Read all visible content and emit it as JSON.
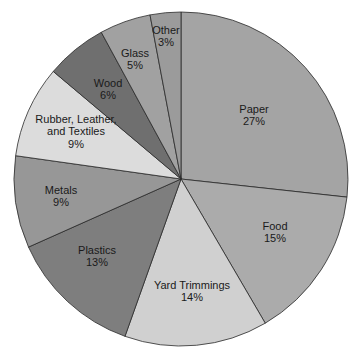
{
  "chart_data": {
    "type": "pie",
    "title": "",
    "start_angle_deg": 0,
    "direction": "clockwise",
    "legend": "none",
    "slices": [
      {
        "label": "Paper",
        "value": 27,
        "display": "27%",
        "color": "#a4a4a4",
        "label_lines": [
          "Paper"
        ],
        "lx": 254,
        "ly": 115
      },
      {
        "label": "Food",
        "value": 15,
        "display": "15%",
        "color": "#ababab",
        "label_lines": [
          "Food"
        ],
        "lx": 275,
        "ly": 232
      },
      {
        "label": "Yard Trimmings",
        "value": 14,
        "display": "14%",
        "color": "#d0d0d0",
        "label_lines": [
          "Yard Trimmings"
        ],
        "lx": 192,
        "ly": 291
      },
      {
        "label": "Plastics",
        "value": 13,
        "display": "13%",
        "color": "#7e7e7e",
        "label_lines": [
          "Plastics"
        ],
        "lx": 97,
        "ly": 256
      },
      {
        "label": "Metals",
        "value": 9,
        "display": "9%",
        "color": "#979797",
        "label_lines": [
          "Metals"
        ],
        "lx": 61,
        "ly": 196
      },
      {
        "label": "Rubber, Leather, and Textiles",
        "value": 9,
        "display": "9%",
        "color": "#dcdcdc",
        "label_lines": [
          "Rubber, Leather,",
          "and Textiles"
        ],
        "lx": 76,
        "ly": 131
      },
      {
        "label": "Wood",
        "value": 6,
        "display": "6%",
        "color": "#6f6f6f",
        "label_lines": [
          "Wood"
        ],
        "lx": 108,
        "ly": 89
      },
      {
        "label": "Glass",
        "value": 5,
        "display": "5%",
        "color": "#a1a1a1",
        "label_lines": [
          "Glass"
        ],
        "lx": 135,
        "ly": 59
      },
      {
        "label": "Other",
        "value": 3,
        "display": "3%",
        "color": "#9b9b9b",
        "label_lines": [
          "Other"
        ],
        "lx": 166,
        "ly": 36
      }
    ],
    "center": [
      181,
      179
    ],
    "radius": 167
  }
}
